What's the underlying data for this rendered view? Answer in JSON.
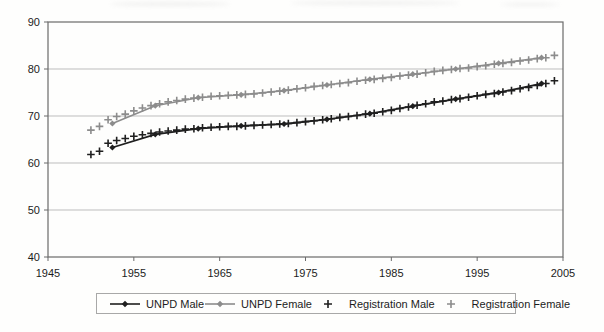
{
  "figure": {
    "background": "#fefefd",
    "title": ""
  },
  "chart_data": {
    "type": "line",
    "title": "",
    "xlabel": "",
    "ylabel": "",
    "xlim": [
      1945,
      2005
    ],
    "ylim": [
      40,
      90
    ],
    "x_ticks": [
      "1945",
      "1955",
      "1965",
      "1975",
      "1985",
      "1995",
      "2005"
    ],
    "y_ticks": [
      "90",
      "80",
      "70",
      "60",
      "50",
      "40"
    ],
    "y_tick_values": [
      90,
      80,
      70,
      60,
      50,
      40
    ],
    "x_tick_values": [
      1945,
      1955,
      1965,
      1975,
      1985,
      1995,
      2005
    ],
    "grid": "horizontal-only",
    "legend_position": "bottom",
    "colors": {
      "male": "#1f1f1f",
      "female": "#8c8c8c",
      "grid": "#bdbdbd",
      "border": "#6a6a6a",
      "text": "#1c1c1c"
    },
    "x_unpd": [
      1952.5,
      1957.5,
      1962.5,
      1967.5,
      1972.5,
      1977.5,
      1982.5,
      1987.5,
      1992.5,
      1997.5,
      2002.5
    ],
    "x_registration": [
      1950,
      1951,
      1952,
      1953,
      1954,
      1955,
      1956,
      1957,
      1958,
      1959,
      1960,
      1961,
      1962,
      1963,
      1964,
      1965,
      1966,
      1967,
      1968,
      1969,
      1970,
      1971,
      1972,
      1973,
      1974,
      1975,
      1976,
      1977,
      1978,
      1979,
      1980,
      1981,
      1982,
      1983,
      1984,
      1985,
      1986,
      1987,
      1988,
      1989,
      1990,
      1991,
      1992,
      1993,
      1994,
      1995,
      1996,
      1997,
      1998,
      1999,
      2000,
      2001,
      2002,
      2003,
      2004
    ],
    "series": [
      {
        "name": "UNPD Male",
        "x_key": "x_unpd",
        "marker": "diamond",
        "line": true,
        "color_key": "male",
        "values": [
          63.3,
          66.1,
          67.3,
          67.9,
          68.3,
          69.3,
          70.5,
          72.1,
          73.6,
          75.0,
          76.9
        ]
      },
      {
        "name": "UNPD Female",
        "x_key": "x_unpd",
        "marker": "diamond",
        "line": true,
        "color_key": "female",
        "values": [
          68.4,
          72.2,
          73.9,
          74.5,
          75.4,
          76.6,
          77.8,
          78.9,
          80.0,
          81.2,
          82.4
        ]
      },
      {
        "name": "Registration Male",
        "x_key": "x_registration",
        "marker": "plus",
        "line": false,
        "color_key": "male",
        "values": [
          61.8,
          62.5,
          64.2,
          64.8,
          65.2,
          65.7,
          66.0,
          66.3,
          66.6,
          66.8,
          67.0,
          67.2,
          67.3,
          67.5,
          67.6,
          67.7,
          67.8,
          67.8,
          67.9,
          68.0,
          68.1,
          68.2,
          68.3,
          68.4,
          68.6,
          68.8,
          69.0,
          69.2,
          69.4,
          69.7,
          69.9,
          70.1,
          70.4,
          70.6,
          70.9,
          71.2,
          71.6,
          71.9,
          72.3,
          72.6,
          73.0,
          73.2,
          73.5,
          73.7,
          74.0,
          74.3,
          74.6,
          74.8,
          75.1,
          75.4,
          75.8,
          76.1,
          76.5,
          76.9,
          77.5
        ]
      },
      {
        "name": "Registration Female",
        "x_key": "x_registration",
        "marker": "plus",
        "line": false,
        "color_key": "female",
        "values": [
          67.0,
          67.8,
          69.2,
          69.9,
          70.4,
          71.1,
          71.7,
          72.2,
          72.6,
          73.0,
          73.3,
          73.6,
          73.8,
          74.0,
          74.2,
          74.3,
          74.4,
          74.5,
          74.6,
          74.7,
          74.9,
          75.1,
          75.3,
          75.5,
          75.8,
          76.0,
          76.3,
          76.5,
          76.7,
          76.9,
          77.1,
          77.4,
          77.6,
          77.8,
          78.0,
          78.2,
          78.5,
          78.7,
          78.9,
          79.2,
          79.5,
          79.7,
          79.9,
          80.1,
          80.2,
          80.5,
          80.7,
          81.0,
          81.2,
          81.4,
          81.7,
          81.9,
          82.2,
          82.4,
          82.9
        ]
      }
    ]
  },
  "legend": {
    "items": [
      "UNPD Male",
      "UNPD Female",
      "Registration Male",
      "Registration Female"
    ]
  }
}
